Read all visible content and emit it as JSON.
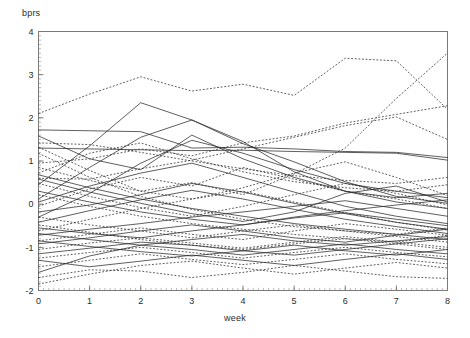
{
  "figure": {
    "ylabel": "bprs",
    "xlabel": "week"
  },
  "chart_data": {
    "type": "line",
    "title": "",
    "subtitle": "",
    "xlabel": "week",
    "ylabel": "bprs",
    "xlim": [
      0,
      8
    ],
    "ylim": [
      -2,
      4
    ],
    "xticks": [
      0,
      1,
      2,
      3,
      4,
      5,
      6,
      7,
      8
    ],
    "yticks": [
      -2,
      -1,
      0,
      1,
      2,
      3,
      4
    ],
    "xtick_labels": [
      "0",
      "1",
      "2",
      "3",
      "4",
      "5",
      "6",
      "7",
      "8"
    ],
    "ytick_labels": [
      "-2",
      "-1",
      "0",
      "1",
      "2",
      "3",
      "4"
    ],
    "x_minor_tick_step": 0.1,
    "y_minor_tick_step": 0.1,
    "grid": false,
    "legend": null,
    "legend_position": "none",
    "annotations": [],
    "line_color": "#2a2a2a",
    "line_width": 0.75,
    "background": "#ffffff",
    "frame_color": "#7a7a7a",
    "x": [
      0,
      1,
      2,
      3,
      4,
      5,
      6,
      7,
      8
    ],
    "series": [
      {
        "name": "subject-01",
        "style": "dashed",
        "values": [
          2.1,
          2.55,
          2.95,
          2.62,
          2.78,
          2.52,
          3.38,
          3.32,
          2.2
        ]
      },
      {
        "name": "subject-02",
        "style": "dashed",
        "values": [
          0.95,
          1.05,
          1.28,
          1.12,
          1.42,
          1.58,
          1.88,
          2.08,
          2.28
        ]
      },
      {
        "name": "subject-03",
        "style": "dashed",
        "values": [
          1.32,
          0.78,
          0.3,
          0.5,
          0.22,
          0.7,
          1.3,
          2.45,
          3.5
        ]
      },
      {
        "name": "subject-04",
        "style": "dashed",
        "values": [
          0.6,
          0.58,
          0.82,
          1.02,
          1.28,
          1.55,
          1.82,
          2.02,
          1.5
        ]
      },
      {
        "name": "subject-05",
        "style": "solid",
        "values": [
          1.72,
          1.7,
          1.68,
          1.3,
          1.32,
          1.28,
          1.22,
          1.2,
          1.08
        ]
      },
      {
        "name": "subject-06",
        "style": "solid",
        "values": [
          1.3,
          1.28,
          1.26,
          1.24,
          1.25,
          1.22,
          1.2,
          1.18,
          1.02
        ]
      },
      {
        "name": "subject-07",
        "style": "solid",
        "values": [
          0.45,
          1.35,
          2.35,
          1.95,
          1.45,
          0.75,
          0.3,
          0.05,
          -0.1
        ]
      },
      {
        "name": "subject-08",
        "style": "solid",
        "values": [
          0.12,
          0.85,
          1.55,
          1.95,
          1.4,
          0.98,
          0.52,
          0.18,
          0.02
        ]
      },
      {
        "name": "subject-09",
        "style": "solid",
        "values": [
          1.58,
          1.05,
          0.8,
          1.6,
          1.05,
          0.62,
          0.3,
          0.15,
          0.25
        ]
      },
      {
        "name": "subject-10",
        "style": "solid",
        "values": [
          -0.3,
          0.25,
          0.95,
          1.48,
          1.18,
          0.8,
          0.48,
          0.3,
          0.15
        ]
      },
      {
        "name": "subject-11",
        "style": "dashed",
        "values": [
          1.42,
          1.38,
          1.2,
          1.0,
          0.82,
          0.66,
          0.55,
          0.48,
          0.62
        ]
      },
      {
        "name": "subject-12",
        "style": "dashed",
        "values": [
          0.72,
          1.18,
          1.42,
          1.05,
          0.75,
          0.52,
          0.38,
          0.3,
          0.45
        ]
      },
      {
        "name": "subject-13",
        "style": "dashed",
        "values": [
          1.18,
          0.62,
          0.18,
          -0.12,
          -0.35,
          -0.52,
          -0.62,
          -0.7,
          -0.55
        ]
      },
      {
        "name": "subject-14",
        "style": "solid",
        "values": [
          0.58,
          0.28,
          0.02,
          -0.22,
          -0.4,
          -0.18,
          0.25,
          0.42,
          0.05
        ]
      },
      {
        "name": "subject-15",
        "style": "solid",
        "values": [
          0.05,
          0.42,
          0.72,
          0.95,
          0.62,
          0.28,
          -0.05,
          -0.28,
          -0.45
        ]
      },
      {
        "name": "subject-16",
        "style": "dashed",
        "values": [
          0.85,
          0.55,
          0.3,
          0.12,
          0.38,
          0.72,
          0.98,
          0.62,
          0.2
        ]
      },
      {
        "name": "subject-17",
        "style": "dashed",
        "values": [
          -0.05,
          0.35,
          0.62,
          0.42,
          0.85,
          0.58,
          0.3,
          0.12,
          -0.1
        ]
      },
      {
        "name": "subject-18",
        "style": "solid",
        "values": [
          0.3,
          0.05,
          -0.18,
          -0.35,
          -0.48,
          -0.3,
          -0.15,
          -0.02,
          0.1
        ]
      },
      {
        "name": "subject-19",
        "style": "solid",
        "values": [
          -0.18,
          -0.02,
          0.22,
          0.48,
          0.28,
          0.02,
          -0.22,
          -0.42,
          -0.58
        ]
      },
      {
        "name": "subject-20",
        "style": "dashed",
        "values": [
          0.48,
          0.18,
          -0.08,
          -0.28,
          -0.05,
          0.22,
          0.48,
          0.25,
          -0.02
        ]
      },
      {
        "name": "subject-21",
        "style": "solid",
        "values": [
          -0.42,
          -0.15,
          0.1,
          0.32,
          0.12,
          -0.12,
          -0.35,
          -0.52,
          -0.68
        ]
      },
      {
        "name": "subject-22",
        "style": "solid",
        "values": [
          0.68,
          0.38,
          0.12,
          -0.1,
          -0.28,
          -0.45,
          -0.58,
          -0.7,
          -0.82
        ]
      },
      {
        "name": "subject-23",
        "style": "dashed",
        "values": [
          -0.62,
          -0.35,
          -0.1,
          0.12,
          0.3,
          0.05,
          -0.2,
          -0.42,
          -0.6
        ]
      },
      {
        "name": "subject-24",
        "style": "dashed",
        "values": [
          0.22,
          -0.05,
          -0.28,
          -0.45,
          -0.58,
          -0.7,
          -0.8,
          -0.88,
          -0.72
        ]
      },
      {
        "name": "subject-25",
        "style": "solid",
        "values": [
          -0.72,
          -0.58,
          -0.45,
          -0.3,
          -0.18,
          -0.05,
          0.08,
          -0.1,
          -0.28
        ]
      },
      {
        "name": "subject-26",
        "style": "solid",
        "values": [
          -0.55,
          -0.68,
          -0.78,
          -0.62,
          -0.48,
          -0.32,
          -0.2,
          -0.35,
          -0.5
        ]
      },
      {
        "name": "subject-27",
        "style": "dashed",
        "values": [
          -0.85,
          -0.7,
          -0.55,
          -0.7,
          -0.82,
          -0.62,
          -0.45,
          -0.58,
          -0.72
        ]
      },
      {
        "name": "subject-28",
        "style": "dashed",
        "values": [
          -0.3,
          -0.48,
          -0.62,
          -0.78,
          -0.62,
          -0.48,
          -0.62,
          -0.75,
          -0.88
        ]
      },
      {
        "name": "subject-29",
        "style": "solid",
        "values": [
          -0.92,
          -0.78,
          -0.62,
          -0.48,
          -0.62,
          -0.78,
          -0.88,
          -0.72,
          -0.58
        ]
      },
      {
        "name": "subject-30",
        "style": "solid",
        "values": [
          -0.68,
          -0.82,
          -0.95,
          -0.82,
          -0.7,
          -0.85,
          -0.95,
          -0.85,
          -0.75
        ]
      },
      {
        "name": "subject-31",
        "style": "dashed",
        "values": [
          -1.05,
          -0.9,
          -0.78,
          -0.9,
          -1.02,
          -0.88,
          -0.75,
          -0.88,
          -1.0
        ]
      },
      {
        "name": "subject-32",
        "style": "dashed",
        "values": [
          -0.48,
          -0.65,
          -0.82,
          -0.95,
          -1.05,
          -0.92,
          -0.8,
          -0.92,
          -1.05
        ]
      },
      {
        "name": "subject-33",
        "style": "solid",
        "values": [
          -1.15,
          -1.02,
          -0.88,
          -0.95,
          -1.08,
          -1.18,
          -1.05,
          -0.92,
          -0.8
        ]
      },
      {
        "name": "subject-34",
        "style": "solid",
        "values": [
          -0.85,
          -0.98,
          -1.1,
          -1.2,
          -1.08,
          -0.95,
          -1.08,
          -1.18,
          -1.05
        ]
      },
      {
        "name": "subject-35",
        "style": "dashed",
        "values": [
          -1.25,
          -1.12,
          -1.0,
          -1.12,
          -1.25,
          -1.12,
          -1.0,
          -1.12,
          -1.22
        ]
      },
      {
        "name": "subject-36",
        "style": "dashed",
        "values": [
          -1.45,
          -1.3,
          -1.15,
          -1.28,
          -1.4,
          -1.28,
          -1.15,
          -1.28,
          -1.38
        ]
      },
      {
        "name": "subject-37",
        "style": "solid",
        "values": [
          -1.58,
          -1.2,
          -0.95,
          -1.05,
          -1.18,
          -1.05,
          -0.92,
          -1.05,
          -1.15
        ]
      },
      {
        "name": "subject-38",
        "style": "solid",
        "values": [
          -1.3,
          -1.45,
          -1.32,
          -1.18,
          -1.3,
          -1.42,
          -1.28,
          -1.15,
          -1.28
        ]
      },
      {
        "name": "subject-39",
        "style": "dashed",
        "values": [
          -1.85,
          -1.62,
          -1.42,
          -1.32,
          -1.48,
          -1.62,
          -1.48,
          -1.35,
          -1.48
        ]
      },
      {
        "name": "subject-40",
        "style": "dashed",
        "values": [
          -1.7,
          -1.52,
          -1.55,
          -1.7,
          -1.58,
          -1.42,
          -1.55,
          -1.68,
          -1.72
        ]
      }
    ]
  }
}
